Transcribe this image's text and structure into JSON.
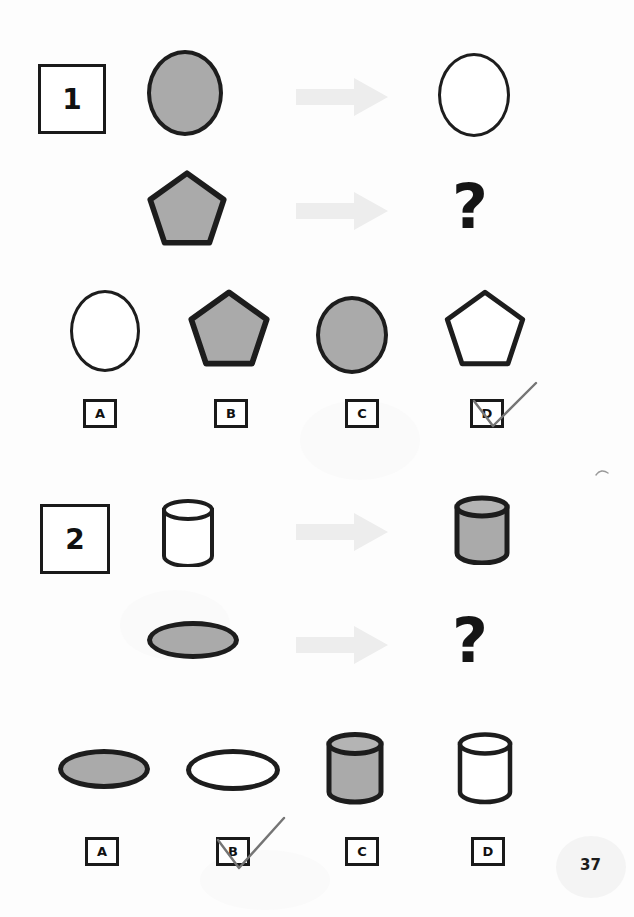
{
  "page": {
    "page_number": "37",
    "background_color": "#fdfdfd",
    "ink_color": "#1a1a1a",
    "shape_fill_gray": "#aaaaaa",
    "arrow_color": "#ededed",
    "pen_mark_color": "#6b6b6b"
  },
  "puzzles": [
    {
      "number_label": "1",
      "prompt_row": {
        "source_shape": "filled-gray-ellipse",
        "arrow_icon": "right-arrow-icon",
        "result_shape": "outline-white-ellipse"
      },
      "question_row": {
        "source_shape": "filled-gray-pentagon",
        "arrow_icon": "right-arrow-icon",
        "result_shape": "question-mark",
        "question_mark": "?"
      },
      "options": [
        {
          "letter": "A",
          "shape": "outline-white-ellipse",
          "marked": false
        },
        {
          "letter": "B",
          "shape": "filled-gray-pentagon",
          "marked": false
        },
        {
          "letter": "C",
          "shape": "filled-gray-ellipse",
          "marked": false
        },
        {
          "letter": "D",
          "shape": "outline-white-pentagon",
          "marked": true
        }
      ],
      "selected_option": "D"
    },
    {
      "number_label": "2",
      "prompt_row": {
        "source_shape": "outline-white-cylinder",
        "arrow_icon": "right-arrow-icon",
        "result_shape": "filled-gray-cylinder"
      },
      "question_row": {
        "source_shape": "filled-gray-flat-ellipse",
        "arrow_icon": "right-arrow-icon",
        "result_shape": "question-mark",
        "question_mark": "?"
      },
      "options": [
        {
          "letter": "A",
          "shape": "filled-gray-flat-ellipse",
          "marked": false
        },
        {
          "letter": "B",
          "shape": "outline-white-flat-ellipse",
          "marked": true
        },
        {
          "letter": "C",
          "shape": "filled-gray-cylinder",
          "marked": false
        },
        {
          "letter": "D",
          "shape": "outline-white-cylinder",
          "marked": false
        }
      ],
      "selected_option": "B"
    }
  ]
}
